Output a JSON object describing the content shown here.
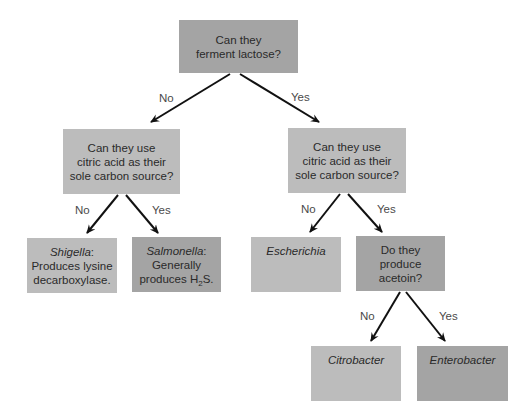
{
  "diagram": {
    "type": "decision-tree",
    "nodes": {
      "root": {
        "lines": [
          "Can they",
          "ferment lactose?"
        ]
      },
      "q_left": {
        "lines": [
          "Can they use",
          "citric acid as their",
          "sole carbon source?"
        ]
      },
      "q_right": {
        "lines": [
          "Can they use",
          "citric acid as their",
          "sole carbon source?"
        ]
      },
      "shigella": {
        "name": "Shigella",
        "suffix": ":",
        "lines": [
          "Produces lysine",
          "decarboxylase."
        ]
      },
      "salmonella": {
        "name": "Salmonella",
        "suffix": ":",
        "lines": [
          "Generally"
        ],
        "h2s_prefix": "produces H",
        "h2s_sub": "2",
        "h2s_suffix": "S."
      },
      "escherichia": {
        "name": "Escherichia"
      },
      "acetoin": {
        "lines": [
          "Do they",
          "produce",
          "acetoin?"
        ]
      },
      "citrobacter": {
        "name": "Citrobacter"
      },
      "enterobacter": {
        "name": "Enterobacter"
      }
    },
    "edge_labels": {
      "root_no": "No",
      "root_yes": "Yes",
      "left_no": "No",
      "left_yes": "Yes",
      "right_no": "No",
      "right_yes": "Yes",
      "acetoin_no": "No",
      "acetoin_yes": "Yes"
    },
    "colors": {
      "dark_box": "#a4a4a4",
      "light_box": "#bcbcbc",
      "arrow": "#111111",
      "text": "#2a2a2a"
    }
  }
}
